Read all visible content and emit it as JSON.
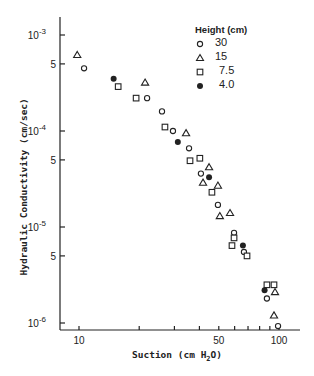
{
  "chart_data": {
    "type": "scatter",
    "title": "",
    "xlabel": "Suction (cm H2O)",
    "ylabel": "Hydraulic Conductivity (cm/sec)",
    "xscale": "log",
    "yscale": "log",
    "xlim": [
      8.3,
      115
    ],
    "ylim": [
      8e-07,
      0.0015
    ],
    "x_ticks": [
      10,
      20,
      30,
      40,
      50,
      60,
      70,
      80,
      90,
      100
    ],
    "x_tick_labels": [
      "10",
      "",
      "",
      "",
      "50",
      "",
      "",
      "",
      "",
      "100"
    ],
    "y_tick_labels": [
      "10^-3",
      "5",
      "10^-4",
      "5",
      "10^-5",
      "5",
      "10^-6"
    ],
    "y_ticks": [
      0.001,
      0.0005,
      0.0001,
      5e-05,
      1e-05,
      5e-06,
      1e-06
    ],
    "grid": false,
    "legend": {
      "title": "Height (cm)",
      "position": "top-right"
    },
    "series": [
      {
        "name": "30",
        "marker": "open-circle",
        "x": [
          10.6,
          21.9,
          26.0,
          29.5,
          35.5,
          40.7,
          49.5,
          59.6,
          66.8,
          87.0,
          98.9
        ],
        "y": [
          0.00045,
          0.00022,
          0.00016,
          0.0001,
          6.6e-05,
          3.6e-05,
          1.7e-05,
          8.7e-06,
          5.5e-06,
          1.8e-06,
          9.3e-07
        ]
      },
      {
        "name": "15",
        "marker": "open-triangle",
        "x": [
          9.8,
          21.4,
          34.3,
          44.7,
          41.7,
          49.5,
          50.6,
          56.9,
          95.5,
          94.4
        ],
        "y": [
          0.00062,
          0.00032,
          9.5e-05,
          4.2e-05,
          2.9e-05,
          2.7e-05,
          1.3e-05,
          1.4e-05,
          2.1e-06,
          1.2e-06
        ]
      },
      {
        "name": "7.5",
        "marker": "open-square",
        "x": [
          15.7,
          19.3,
          26.9,
          35.9,
          40.2,
          46.2,
          59.6,
          58.2,
          69.2,
          87.0,
          94.4
        ],
        "y": [
          0.00029,
          0.00022,
          0.00011,
          4.9e-05,
          5.2e-05,
          2.3e-05,
          7.7e-06,
          6.4e-06,
          5e-06,
          2.5e-06,
          2.5e-06
        ]
      },
      {
        "name": "4.0",
        "marker": "filled-circle",
        "x": [
          14.9,
          31.2,
          44.7,
          66.0,
          84.7
        ],
        "y": [
          0.00035,
          7.7e-05,
          3.3e-05,
          6.4e-06,
          2.2e-06
        ]
      }
    ]
  },
  "labels": {
    "ylabel": "Hydraulic Conductivity (cm/sec)",
    "xlabel_prefix": "Suction (cm H",
    "xlabel_sub": "2",
    "xlabel_suffix": "O)",
    "legend_title": "Height (cm)",
    "legend_items": [
      "30",
      "15",
      "7.5",
      "4.0"
    ]
  }
}
